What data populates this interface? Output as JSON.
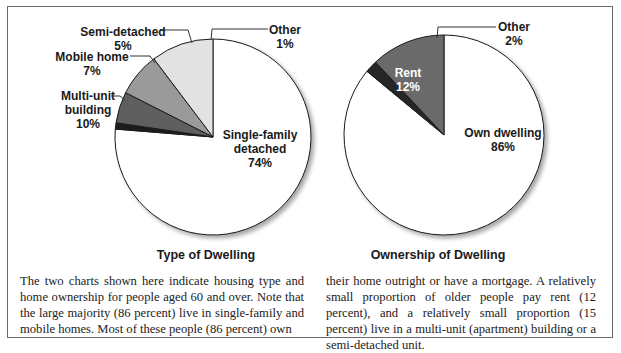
{
  "chart_data": [
    {
      "type": "pie",
      "title": "Type of Dwelling",
      "categories": [
        "Single-family detached",
        "Multi-unit building",
        "Mobile home",
        "Semi-detached",
        "Other"
      ],
      "values": [
        74,
        10,
        7,
        5,
        1
      ],
      "labels": [
        {
          "line1": "Single-family",
          "line2": "detached",
          "pct": "74%"
        },
        {
          "line1": "Multi-unit",
          "line2": "building",
          "pct": "10%"
        },
        {
          "line1": "Mobile home",
          "pct": "7%"
        },
        {
          "line1": "Semi-detached",
          "pct": "5%"
        },
        {
          "line1": "Other",
          "pct": "1%"
        }
      ],
      "colors": [
        "#ffffff",
        "#e2e2e2",
        "#9a9a9a",
        "#5e5e5e",
        "#1e1e1e"
      ],
      "unit": "percent"
    },
    {
      "type": "pie",
      "title": "Ownership of Dwelling",
      "categories": [
        "Own dwelling",
        "Rent",
        "Other"
      ],
      "values": [
        86,
        12,
        2
      ],
      "labels": [
        {
          "line1": "Own dwelling",
          "pct": "86%"
        },
        {
          "line1": "Rent",
          "pct": "12%"
        },
        {
          "line1": "Other",
          "pct": "2%"
        }
      ],
      "colors": [
        "#ffffff",
        "#6a6a6a",
        "#262626"
      ],
      "unit": "percent"
    }
  ],
  "caption": {
    "left": "The two charts shown here indicate housing type and home ownership for people aged 60 and over. Note that the large majority (86 percent) live in single-family and mobile homes. Most of these people (86 percent) own",
    "right": "their home outright or have a mortgage. A relatively small proportion of older people pay rent (12 percent), and a relatively small proportion (15 percent) live in a multi-unit (apartment) building or a semi-detached unit."
  }
}
